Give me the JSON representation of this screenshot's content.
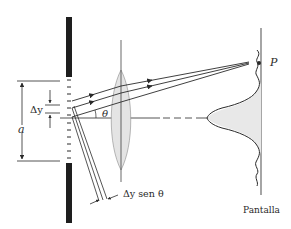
{
  "figure": {
    "type": "single-slit diffraction with lens focusing onto screen",
    "labels": {
      "delta_y": "Δy",
      "slit_width": "a",
      "angle": "θ",
      "path_difference": "Δy sen θ",
      "point": "P",
      "screen": "Pantalla"
    },
    "colors": {
      "ink": "#2a2a2a",
      "barrier": "#1e1e1e",
      "lens_fill": "#e4e4e4",
      "intensity_fill": "#e8e8e8",
      "screen_line": "#6a6a6a"
    }
  }
}
